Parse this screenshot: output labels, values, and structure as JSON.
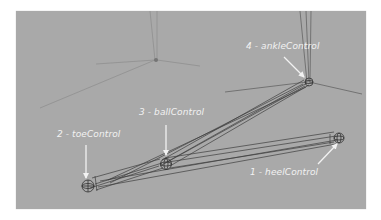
{
  "viewport": {
    "background": "#a9a9a9",
    "wire_color": "#4a4a4a",
    "annotation_color": "#f2f2f2"
  },
  "annotations": [
    {
      "number": "1",
      "name": "heelControl",
      "text": "1 - heelControl"
    },
    {
      "number": "2",
      "name": "toeControl",
      "text": "2 - toeControl"
    },
    {
      "number": "3",
      "name": "ballControl",
      "text": "3 - ballControl"
    },
    {
      "number": "4",
      "name": "ankleControl",
      "text": "4 - ankleControl"
    }
  ]
}
